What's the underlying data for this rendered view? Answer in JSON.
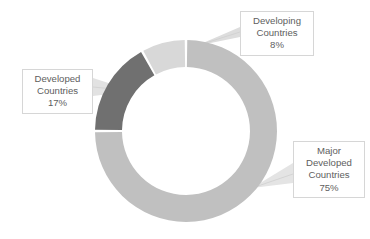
{
  "chart_data": {
    "type": "pie",
    "variant": "donut",
    "title": "",
    "subtitle": "",
    "xlabel": "",
    "ylabel": "",
    "grid": false,
    "legend_position": "none",
    "labels_as_callouts": true,
    "total_percent": 100,
    "start_angle_deg": 0,
    "direction": "clockwise",
    "inner_radius_ratio": 0.7,
    "categories": [
      "Major Developed Countries",
      "Developed Countries",
      "Developing Countries"
    ],
    "values": [
      75,
      17,
      8
    ],
    "value_suffix": "%",
    "colors": [
      "#c0c0c0",
      "#707070",
      "#d8d8d8"
    ],
    "slices": [
      {
        "name": "Major Developed Countries",
        "value": 75,
        "value_label": "75%",
        "color": "#c0c0c0",
        "start_deg": 0,
        "end_deg": 270
      },
      {
        "name": "Developed Countries",
        "value": 17,
        "value_label": "17%",
        "color": "#707070",
        "start_deg": 270,
        "end_deg": 331.2
      },
      {
        "name": "Developing Countries",
        "value": 8,
        "value_label": "8%",
        "color": "#d8d8d8",
        "start_deg": 331.2,
        "end_deg": 360
      }
    ]
  },
  "callouts": {
    "developing": {
      "line1": "Developing",
      "line2": "Countries",
      "line3": "8%"
    },
    "developed": {
      "line1": "Developed",
      "line2": "Countries",
      "line3": "17%"
    },
    "major_developed": {
      "line1": "Major",
      "line2": "Developed",
      "line3": "Countries",
      "line4": "75%"
    }
  },
  "style": {
    "background": "#ffffff",
    "text_color": "#5e5e5e",
    "callout_border": "#d6d6d6",
    "leader_line_color": "#d0d0d0",
    "slice_gap_color": "#ffffff"
  }
}
